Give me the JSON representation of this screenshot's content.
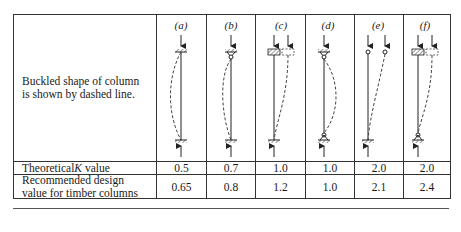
{
  "table": {
    "row_labels": {
      "diagram": "Buckled shape of column is shown by dashed line.",
      "theoretical_prefix": "Theoretical ",
      "theoretical_k": "K",
      "theoretical_suffix": " value",
      "recommended_line1": "Recommended design",
      "recommended_line2": "value for timber columns"
    },
    "columns": [
      {
        "label": "(a)",
        "theoretical": "0.5",
        "recommended": "0.65",
        "top": "fixed",
        "bottom": "fixed",
        "shape": "fixed-fixed"
      },
      {
        "label": "(b)",
        "theoretical": "0.7",
        "recommended": "0.8",
        "top": "pinned",
        "bottom": "fixed",
        "shape": "pinned-fixed"
      },
      {
        "label": "(c)",
        "theoretical": "1.0",
        "recommended": "1.2",
        "top": "fixed-sway",
        "bottom": "fixed",
        "shape": "sway-fixed"
      },
      {
        "label": "(d)",
        "theoretical": "1.0",
        "recommended": "1.0",
        "top": "pinned",
        "bottom": "pinned",
        "shape": "pinned-pinned"
      },
      {
        "label": "(e)",
        "theoretical": "2.0",
        "recommended": "2.1",
        "top": "free",
        "bottom": "fixed",
        "shape": "free-fixed"
      },
      {
        "label": "(f)",
        "theoretical": "2.0",
        "recommended": "2.4",
        "top": "fixed-sway",
        "bottom": "pinned",
        "shape": "sway-pinned"
      }
    ]
  }
}
